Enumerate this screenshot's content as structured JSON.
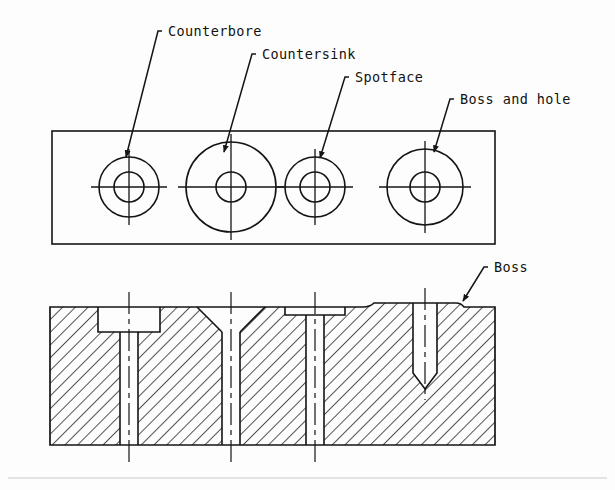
{
  "drawing": {
    "title": "Machined plate hole features - plan and sectional views",
    "line_color": "#141414",
    "hatch_color": "#1a1a1a",
    "background_color": "#fdfdfd",
    "faint_rule_color": "#c9c9c9",
    "views": [
      {
        "name": "plan-view",
        "type": "top view",
        "outline": {
          "x": 52,
          "y": 131,
          "width": 443,
          "height": 113
        }
      },
      {
        "name": "sectional-view",
        "type": "section",
        "outline": {
          "x": 50,
          "y": 303,
          "width": 445,
          "height": 142
        },
        "hatch_angle_degrees": 45
      }
    ],
    "labels": [
      {
        "id": "counterbore",
        "text": "Counterbore",
        "text_x": 168,
        "text_y": 36,
        "elbow_x": 158,
        "elbow_y": 31,
        "leader_from_x": 162,
        "leader_from_y": 31,
        "leader_to_x": 126,
        "leader_to_y": 157
      },
      {
        "id": "countersink",
        "text": "Countersink",
        "text_x": 262,
        "text_y": 59,
        "elbow_x": 252,
        "elbow_y": 54,
        "leader_from_x": 256,
        "leader_from_y": 54,
        "leader_to_x": 224,
        "leader_to_y": 152
      },
      {
        "id": "spotface",
        "text": "Spotface",
        "text_x": 355,
        "text_y": 82,
        "elbow_x": 345,
        "elbow_y": 77,
        "leader_from_x": 349,
        "leader_from_y": 77,
        "leader_to_x": 320,
        "leader_to_y": 158
      },
      {
        "id": "boss-and-hole",
        "text": "Boss and hole",
        "text_x": 460,
        "text_y": 104,
        "elbow_x": 450,
        "elbow_y": 99,
        "leader_from_x": 454,
        "leader_from_y": 99,
        "leader_to_x": 434,
        "leader_to_y": 152
      },
      {
        "id": "boss",
        "text": "Boss",
        "text_x": 494,
        "text_y": 272,
        "elbow_x": 484,
        "elbow_y": 267,
        "leader_from_x": 488,
        "leader_from_y": 267,
        "leader_to_x": 463,
        "leader_to_y": 301
      }
    ],
    "features": [
      {
        "id": "counterbore",
        "label": "Counterbore",
        "center_x": 129,
        "plan_outer_radius": 30,
        "plan_inner_radius": 15,
        "section": {
          "recess_half_width": 31,
          "recess_depth": 25,
          "hole_half_width": 9,
          "through": true,
          "profile": "flat-bottom counterbore with through hole"
        }
      },
      {
        "id": "countersink",
        "label": "Countersink",
        "center_x": 231,
        "plan_outer_radius": 45,
        "plan_inner_radius": 15,
        "section": {
          "recess_half_width": 34,
          "recess_depth": 21,
          "hole_half_width": 9,
          "through": true,
          "profile": "conical countersink with through hole"
        }
      },
      {
        "id": "spotface",
        "label": "Spotface",
        "center_x": 315,
        "plan_outer_radius": 30,
        "plan_inner_radius": 15,
        "section": {
          "recess_half_width": 30,
          "recess_depth": 8,
          "hole_half_width": 9,
          "through": true,
          "profile": "shallow spotface with through hole"
        }
      },
      {
        "id": "boss-and-hole",
        "label": "Boss and hole",
        "center_x": 425,
        "plan_outer_radius": 38,
        "plan_inner_radius": 15,
        "section": {
          "boss_half_width": 62,
          "boss_height": 4,
          "hole_half_width": 12,
          "hole_depth": 70,
          "through": false,
          "profile": "raised boss with blind drilled hole and conical point"
        }
      }
    ]
  }
}
